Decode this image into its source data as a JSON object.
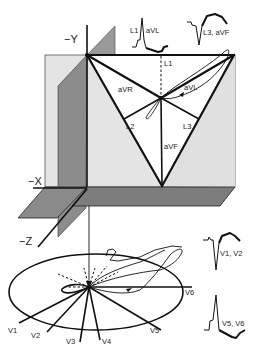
{
  "axes": {
    "neg_y": "−Y",
    "neg_x": "−X",
    "neg_z": "−Z"
  },
  "frontal_plane": {
    "leads": {
      "L1": "L1",
      "L2": "L2",
      "L3": "L3",
      "aVR": "aVR",
      "aVL": "aVL",
      "aVF": "aVF"
    }
  },
  "horizontal_plane": {
    "leads": {
      "V1": "V1",
      "V2": "V2",
      "V3": "V3",
      "V4": "V4",
      "V5": "V5",
      "V6": "V6"
    }
  },
  "waveforms": {
    "top_left": "L1  aVL",
    "top_left_a": "L1",
    "top_left_b": "aVL",
    "top_right": "L3, aVF",
    "right_upper": "V1, V2",
    "right_lower": "V5, V6"
  },
  "colors": {
    "frontal_plane_fill": "#e4e4e4",
    "dark_plane_fill": "#8c8c8c",
    "shelf_fill": "#7a7a7a",
    "stroke": "#111111"
  }
}
